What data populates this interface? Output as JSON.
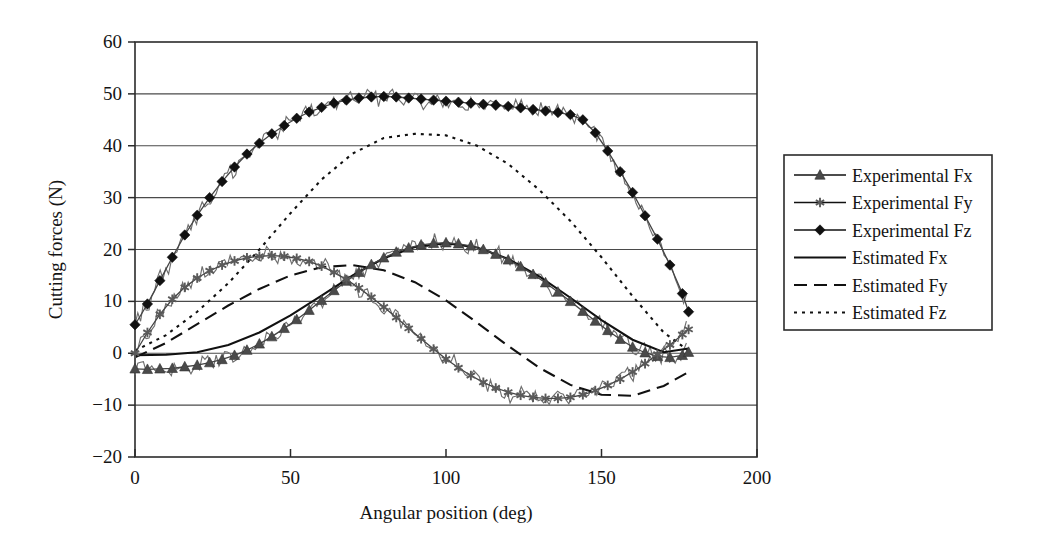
{
  "chart_data": {
    "type": "line",
    "title": "",
    "xlabel": "Angular position (deg)",
    "ylabel": "Cutting forces (N)",
    "xlim": [
      0,
      200
    ],
    "ylim": [
      -20,
      60
    ],
    "xticks": [
      "0",
      "50",
      "100",
      "150",
      "200"
    ],
    "xtick_values": [
      0,
      50,
      100,
      150,
      200
    ],
    "yticks": [
      "60",
      "50",
      "40",
      "30",
      "20",
      "10",
      "0",
      "−10",
      "−20"
    ],
    "ytick_values": [
      60,
      50,
      40,
      30,
      20,
      10,
      0,
      -10,
      -20
    ],
    "grid": "horizontal",
    "legend_position": "right-outside",
    "series": [
      {
        "name": "Experimental Fx",
        "style": "line-with-triangle-markers",
        "marker": "triangle",
        "color": "#444444",
        "x": [
          0,
          4,
          8,
          12,
          16,
          20,
          24,
          28,
          32,
          36,
          40,
          44,
          48,
          52,
          56,
          60,
          64,
          68,
          72,
          76,
          80,
          84,
          88,
          92,
          96,
          100,
          104,
          108,
          112,
          116,
          120,
          124,
          128,
          132,
          136,
          140,
          144,
          148,
          152,
          156,
          160,
          164,
          168,
          172,
          176,
          178
        ],
        "values": [
          -3.0,
          -3.1,
          -3.0,
          -2.9,
          -2.6,
          -2.3,
          -1.8,
          -1.2,
          -0.4,
          0.6,
          1.8,
          3.2,
          4.8,
          6.5,
          8.3,
          10.2,
          12.1,
          13.9,
          15.6,
          17.1,
          18.4,
          19.5,
          20.3,
          20.9,
          21.2,
          21.3,
          21.1,
          20.7,
          20.0,
          19.1,
          18.0,
          16.7,
          15.2,
          13.6,
          11.8,
          10.0,
          8.1,
          6.2,
          4.4,
          2.7,
          1.2,
          0.1,
          -0.6,
          -0.8,
          -0.4,
          0.2
        ]
      },
      {
        "name": "Experimental Fy",
        "style": "line-with-asterisk-markers",
        "marker": "asterisk",
        "color": "#5a5a5a",
        "x": [
          0,
          4,
          8,
          12,
          16,
          20,
          24,
          28,
          32,
          36,
          40,
          44,
          48,
          52,
          56,
          60,
          64,
          68,
          72,
          76,
          80,
          84,
          88,
          92,
          96,
          100,
          104,
          108,
          112,
          116,
          120,
          124,
          128,
          132,
          136,
          140,
          144,
          148,
          152,
          156,
          160,
          164,
          168,
          172,
          176,
          178
        ],
        "values": [
          0.0,
          4.0,
          7.5,
          10.4,
          12.7,
          14.5,
          15.9,
          17.0,
          17.8,
          18.4,
          18.7,
          18.8,
          18.7,
          18.3,
          17.7,
          16.8,
          15.6,
          14.2,
          12.6,
          10.8,
          8.9,
          6.9,
          4.8,
          2.8,
          0.8,
          -1.1,
          -2.8,
          -4.3,
          -5.6,
          -6.7,
          -7.5,
          -8.1,
          -8.5,
          -8.7,
          -8.7,
          -8.5,
          -8.0,
          -7.2,
          -6.2,
          -5.0,
          -3.6,
          -2.0,
          -0.2,
          1.6,
          3.6,
          4.6
        ]
      },
      {
        "name": "Experimental Fz",
        "style": "line-with-diamond-markers",
        "marker": "diamond",
        "color": "#111111",
        "x": [
          0,
          4,
          8,
          12,
          16,
          20,
          24,
          28,
          32,
          36,
          40,
          44,
          48,
          52,
          56,
          60,
          64,
          68,
          72,
          76,
          80,
          84,
          88,
          92,
          96,
          100,
          104,
          108,
          112,
          116,
          120,
          124,
          128,
          132,
          136,
          140,
          144,
          148,
          152,
          156,
          160,
          164,
          168,
          172,
          176,
          178
        ],
        "values": [
          5.5,
          9.5,
          14.0,
          18.5,
          22.8,
          26.6,
          30.0,
          33.1,
          35.9,
          38.4,
          40.5,
          42.3,
          43.9,
          45.3,
          46.5,
          47.4,
          48.2,
          48.8,
          49.2,
          49.4,
          49.5,
          49.4,
          49.2,
          49.0,
          48.8,
          48.6,
          48.4,
          48.2,
          48.0,
          47.8,
          47.6,
          47.3,
          47.0,
          46.7,
          46.4,
          46.0,
          45.0,
          42.5,
          39.0,
          35.0,
          31.0,
          26.5,
          22.0,
          17.0,
          11.5,
          8.0
        ]
      },
      {
        "name": "Estimated Fx",
        "style": "solid",
        "color": "#111111",
        "x": [
          0,
          10,
          20,
          30,
          40,
          50,
          60,
          70,
          80,
          90,
          100,
          110,
          120,
          130,
          140,
          150,
          160,
          170,
          178
        ],
        "values": [
          -0.4,
          -0.3,
          0.2,
          1.6,
          4.0,
          7.3,
          11.1,
          15.0,
          18.3,
          20.5,
          21.2,
          20.4,
          18.2,
          14.8,
          10.7,
          6.4,
          2.6,
          0.2,
          0.9
        ]
      },
      {
        "name": "Estimated Fy",
        "style": "dashed",
        "color": "#111111",
        "x": [
          0,
          10,
          20,
          30,
          40,
          50,
          60,
          70,
          80,
          90,
          100,
          110,
          120,
          130,
          140,
          150,
          160,
          170,
          178
        ],
        "values": [
          -0.8,
          2.0,
          5.6,
          9.2,
          12.4,
          15.0,
          16.6,
          17.0,
          16.0,
          13.7,
          10.2,
          5.9,
          1.4,
          -2.8,
          -6.1,
          -8.0,
          -8.2,
          -6.3,
          -3.6
        ]
      },
      {
        "name": "Estimated Fz",
        "style": "dotted",
        "color": "#111111",
        "x": [
          0,
          10,
          20,
          30,
          40,
          50,
          60,
          70,
          80,
          90,
          100,
          110,
          120,
          130,
          140,
          150,
          160,
          170,
          178
        ],
        "values": [
          0.5,
          3.5,
          8.0,
          13.5,
          20.0,
          27.0,
          33.5,
          38.5,
          41.5,
          42.3,
          42.0,
          40.0,
          36.5,
          31.5,
          25.5,
          18.5,
          11.0,
          4.0,
          0.5
        ]
      }
    ]
  },
  "legend": {
    "entries": [
      {
        "label": "Experimental Fx",
        "style": "line-with-triangle-markers"
      },
      {
        "label": "Experimental Fy",
        "style": "line-with-asterisk-markers"
      },
      {
        "label": "Experimental Fz",
        "style": "line-with-diamond-markers"
      },
      {
        "label": "Estimated Fx",
        "style": "solid"
      },
      {
        "label": "Estimated Fy",
        "style": "dashed"
      },
      {
        "label": "Estimated Fz",
        "style": "dotted"
      }
    ]
  },
  "axes": {
    "x_title": "Angular position (deg)",
    "y_title": "Cutting forces (N)"
  }
}
